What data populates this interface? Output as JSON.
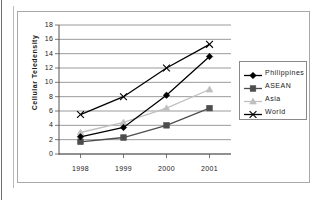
{
  "chart_data": {
    "type": "line",
    "title": "",
    "xlabel": "",
    "ylabel": "Cellular Teledensity",
    "categories": [
      "1998",
      "1999",
      "2000",
      "2001"
    ],
    "ylim": [
      0,
      18
    ],
    "ytick_step": 2,
    "yticks": [
      "18",
      "16",
      "14",
      "12",
      "10",
      "8",
      "6",
      "4",
      "2",
      "0"
    ],
    "grid": "horizontal",
    "legend_position": "right",
    "series": [
      {
        "name": "Philippines",
        "marker": "diamond",
        "color": "#000000",
        "values": [
          2.4,
          3.7,
          8.2,
          13.6
        ]
      },
      {
        "name": "ASEAN",
        "marker": "square",
        "color": "#4d4d4d",
        "values": [
          1.7,
          2.3,
          4.0,
          6.4
        ]
      },
      {
        "name": "Asia",
        "marker": "triangle",
        "color": "#bfbfbf",
        "values": [
          3.0,
          4.4,
          6.4,
          9.0
        ]
      },
      {
        "name": "World",
        "marker": "x",
        "color": "#000000",
        "values": [
          5.5,
          8.0,
          12.0,
          15.3
        ]
      }
    ]
  },
  "colors": {
    "frame_border": "#a8a8a8",
    "gridline": "#808080",
    "axis": "#555555",
    "legend_border": "#8a8a8a",
    "text": "#1a1a1a"
  }
}
